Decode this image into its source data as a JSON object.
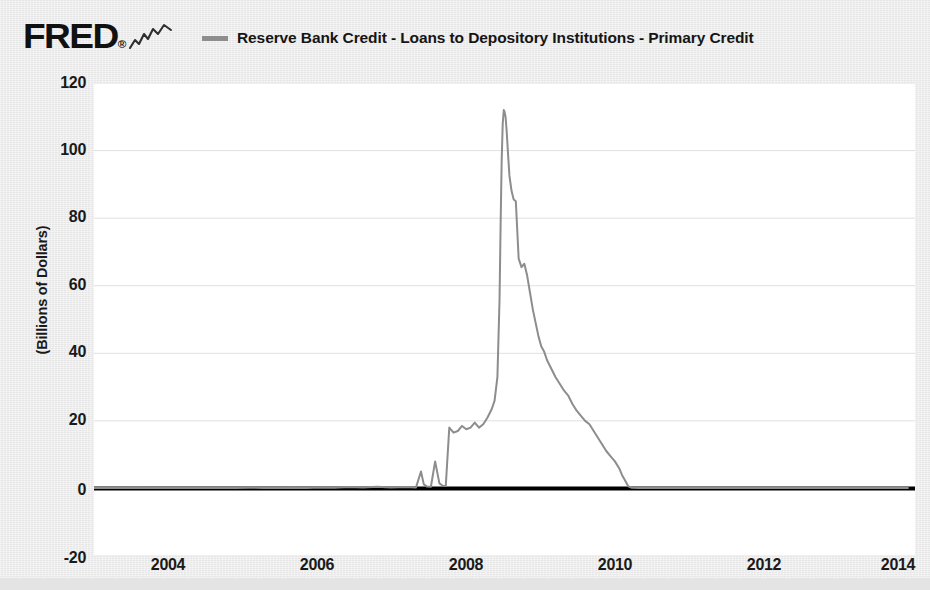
{
  "header": {
    "logo_text": "FRED",
    "logo_mark": "squiggle-trend-icon",
    "registered_mark": "®"
  },
  "legend": {
    "position": "top",
    "entries": [
      {
        "label": "Reserve Bank Credit - Loans to Depository Institutions - Primary Credit",
        "color": "#8d8d8d"
      }
    ]
  },
  "axes": {
    "y_title": "(Billions of Dollars)",
    "y_ticks": [
      "120",
      "100",
      "80",
      "60",
      "40",
      "20",
      "0",
      "-20"
    ],
    "x_ticks": [
      "2004",
      "2006",
      "2008",
      "2010",
      "2012",
      "2014"
    ]
  },
  "chart_data": {
    "type": "line",
    "title": "",
    "subtitle": "",
    "xlabel": "",
    "ylabel": "(Billions of Dollars)",
    "xlim": [
      2003.0,
      2014.6
    ],
    "ylim": [
      -20,
      120
    ],
    "yticks": [
      -20,
      0,
      20,
      40,
      60,
      80,
      100,
      120
    ],
    "xticks": [
      2004,
      2006,
      2008,
      2010,
      2012,
      2014
    ],
    "grid": true,
    "grid_color": "#e0e0e0",
    "zero_line": true,
    "zero_line_color": "#000000",
    "legend_position": "top",
    "series": [
      {
        "name": "Reserve Bank Credit - Loans to Depository Institutions - Primary Credit",
        "color": "#8d8d8d",
        "line_width": 2,
        "x": [
          2003.0,
          2003.2,
          2003.4,
          2003.6,
          2003.8,
          2004.0,
          2004.2,
          2004.4,
          2004.6,
          2004.8,
          2005.0,
          2005.2,
          2005.4,
          2005.6,
          2005.8,
          2006.0,
          2006.2,
          2006.4,
          2006.6,
          2006.8,
          2007.0,
          2007.2,
          2007.4,
          2007.55,
          2007.62,
          2007.66,
          2007.7,
          2007.76,
          2007.82,
          2007.88,
          2007.93,
          2007.97,
          2008.02,
          2008.08,
          2008.14,
          2008.2,
          2008.26,
          2008.32,
          2008.38,
          2008.44,
          2008.5,
          2008.56,
          2008.62,
          2008.66,
          2008.7,
          2008.73,
          2008.745,
          2008.76,
          2008.775,
          2008.79,
          2008.8,
          2008.815,
          2008.83,
          2008.85,
          2008.87,
          2008.9,
          2008.93,
          2008.96,
          2009.0,
          2009.04,
          2009.08,
          2009.12,
          2009.16,
          2009.2,
          2009.24,
          2009.28,
          2009.32,
          2009.36,
          2009.4,
          2009.46,
          2009.52,
          2009.58,
          2009.64,
          2009.7,
          2009.76,
          2009.82,
          2009.88,
          2009.94,
          2010.0,
          2010.06,
          2010.12,
          2010.18,
          2010.24,
          2010.3,
          2010.36,
          2010.42,
          2010.46,
          2010.5,
          2010.55,
          2010.6,
          2010.7,
          2011.0,
          2011.5,
          2012.0,
          2012.5,
          2013.0,
          2013.5,
          2014.0,
          2014.5
        ],
        "y": [
          0.1,
          0.15,
          0.1,
          0.2,
          0.1,
          0.12,
          0.1,
          0.15,
          0.1,
          0.12,
          0.1,
          0.2,
          0.15,
          0.1,
          0.2,
          0.15,
          0.3,
          0.2,
          0.4,
          0.3,
          0.5,
          0.3,
          0.4,
          0.3,
          5.0,
          1.2,
          0.6,
          0.5,
          8.0,
          1.5,
          0.8,
          0.7,
          18.0,
          16.5,
          17.0,
          18.5,
          17.5,
          18.0,
          19.5,
          18.0,
          19.0,
          21.0,
          23.5,
          26.0,
          33.0,
          56.0,
          78.0,
          97.0,
          108.0,
          112.0,
          111.5,
          110.0,
          106.0,
          99.0,
          92.5,
          88.0,
          85.5,
          85.0,
          68.0,
          65.5,
          66.5,
          63.0,
          58.0,
          53.0,
          49.0,
          45.0,
          42.0,
          40.5,
          38.0,
          35.5,
          33.0,
          31.0,
          29.0,
          27.5,
          25.0,
          23.0,
          21.5,
          20.0,
          19.0,
          17.0,
          15.0,
          13.0,
          11.0,
          9.5,
          8.0,
          6.0,
          4.0,
          2.5,
          0.6,
          0.2,
          0.15,
          0.12,
          0.1,
          0.1,
          0.1,
          0.1,
          0.1,
          0.1,
          0.1
        ]
      }
    ],
    "annotations": [
      {
        "text": "peak",
        "x": 2008.79,
        "y": 112.0
      }
    ]
  }
}
